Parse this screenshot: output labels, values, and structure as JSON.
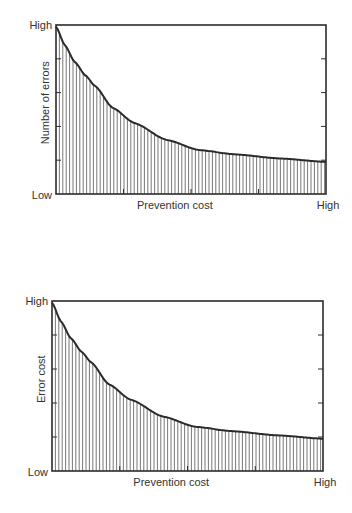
{
  "chart_data": [
    {
      "type": "area",
      "title": "",
      "xlabel": "Prevention cost",
      "ylabel": "Number of errors",
      "x_tick_labels": {
        "end": "High"
      },
      "y_tick_labels": {
        "top": "High",
        "bottom": "Low"
      },
      "xlim": [
        0,
        1
      ],
      "ylim": [
        0,
        1
      ],
      "y_ticks": [
        0.2,
        0.4,
        0.6,
        0.8
      ],
      "x_ticks": [
        0.25,
        0.5,
        0.75
      ],
      "fill_pattern": "vertical-hatching",
      "grid": false,
      "series": [
        {
          "name": "Number of errors",
          "x": [
            0.0,
            0.033,
            0.07,
            0.11,
            0.144,
            0.21,
            0.29,
            0.41,
            0.53,
            0.66,
            0.83,
            1.0
          ],
          "y": [
            0.99,
            0.88,
            0.78,
            0.7,
            0.64,
            0.51,
            0.42,
            0.32,
            0.26,
            0.235,
            0.21,
            0.19
          ]
        }
      ]
    },
    {
      "type": "area",
      "title": "",
      "xlabel": "Prevention cost",
      "ylabel": "Error cost",
      "x_tick_labels": {
        "end": "High"
      },
      "y_tick_labels": {
        "top": "High",
        "bottom": "Low"
      },
      "xlim": [
        0,
        1
      ],
      "ylim": [
        0,
        1
      ],
      "y_ticks": [
        0.2,
        0.4,
        0.6,
        0.8
      ],
      "x_ticks": [
        0.25,
        0.5,
        0.75
      ],
      "fill_pattern": "vertical-hatching",
      "grid": false,
      "series": [
        {
          "name": "Error cost",
          "x": [
            0.0,
            0.033,
            0.07,
            0.11,
            0.144,
            0.21,
            0.29,
            0.41,
            0.53,
            0.66,
            0.83,
            1.0
          ],
          "y": [
            0.99,
            0.88,
            0.78,
            0.7,
            0.64,
            0.51,
            0.42,
            0.32,
            0.26,
            0.235,
            0.21,
            0.19
          ]
        }
      ]
    }
  ]
}
